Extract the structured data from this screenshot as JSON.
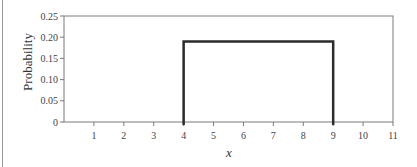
{
  "chart_data": {
    "type": "line",
    "title": "",
    "xlabel": "x",
    "ylabel": "Probability",
    "xlim": [
      0,
      11
    ],
    "ylim": [
      0,
      0.25
    ],
    "x_ticks": [
      1,
      2,
      3,
      4,
      5,
      6,
      7,
      8,
      9,
      10,
      11
    ],
    "x_tick_labels": [
      "1",
      "2",
      "3",
      "4",
      "5",
      "6",
      "7",
      "8",
      "9",
      "10",
      "11"
    ],
    "y_ticks": [
      0,
      0.05,
      0.1,
      0.15,
      0.2,
      0.25
    ],
    "y_tick_labels": [
      "0",
      "0.05",
      "0.10",
      "0.15",
      "0.20",
      "0.25"
    ],
    "grid": false,
    "legend": null,
    "series": [
      {
        "name": "uniform density",
        "description": "Uniform distribution on [4, 9]",
        "points": [
          [
            4,
            0
          ],
          [
            4,
            0.19
          ],
          [
            9,
            0.19
          ],
          [
            9,
            0
          ]
        ],
        "color": "#2b2b2b"
      }
    ],
    "frame_color": "#7a7a7a"
  }
}
